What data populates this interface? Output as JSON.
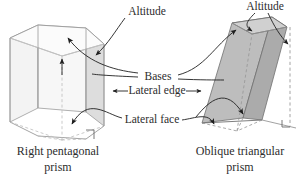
{
  "figure": {
    "background": "#ffffff",
    "ink": "#2d2d2d"
  },
  "labels": {
    "altitude_left": "Altitude",
    "altitude_right": "Altitude",
    "bases": "Bases",
    "lateral_edge": "Lateral edge",
    "lateral_face": "Lateral face"
  },
  "captions": {
    "left_line1": "Right pentagonal",
    "left_line2": "prism",
    "right_line1": "Oblique triangular",
    "right_line2": "prism"
  },
  "shapes": {
    "left_prism": {
      "name": "right pentagonal prism",
      "fill_front": "#f2f2f2",
      "fill_top": "#fafafa",
      "fill_side": "#dcdcdc",
      "stroke": "#8f8f8f",
      "hidden_stroke": "#b6b6b6"
    },
    "right_prism": {
      "name": "oblique triangular prism",
      "fill_front": "#b9b9b9",
      "fill_top": "#cfcfcf",
      "fill_side": "#a8a8a8",
      "stroke": "#6f6f6f",
      "hidden_stroke": "#8a8a8a"
    }
  },
  "markers": {
    "right_angle_left": "right-angle-marker",
    "right_angle_right": "right-angle-marker"
  }
}
